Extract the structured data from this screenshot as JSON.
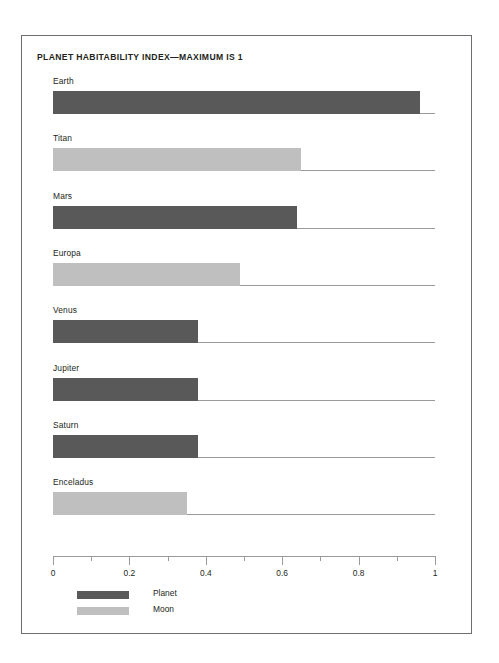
{
  "chart_data": {
    "type": "bar",
    "orientation": "horizontal",
    "title": "PLANET HABITABILITY INDEX—MAXIMUM IS 1",
    "xlabel": "",
    "ylabel": "",
    "xlim": [
      0,
      1
    ],
    "grid": false,
    "legend_position": "bottom-left",
    "categories": [
      "Earth",
      "Titan",
      "Mars",
      "Europa",
      "Venus",
      "Jupiter",
      "Saturn",
      "Enceladus"
    ],
    "values": [
      0.96,
      0.65,
      0.64,
      0.49,
      0.38,
      0.38,
      0.38,
      0.35
    ],
    "groups": [
      "Planet",
      "Moon",
      "Planet",
      "Moon",
      "Planet",
      "Planet",
      "Planet",
      "Moon"
    ],
    "tick_labels": [
      "0",
      "0.2",
      "0.4",
      "0.6",
      "0.8",
      "1"
    ],
    "tick_values": [
      0,
      0.2,
      0.4,
      0.6,
      0.8,
      1
    ],
    "minor_tick_values": [
      0.1,
      0.3,
      0.5,
      0.7,
      0.9
    ],
    "legend": [
      {
        "label": "Planet",
        "color": "#595959"
      },
      {
        "label": "Moon",
        "color": "#bfbfbf"
      }
    ],
    "bars": [
      {
        "label": "Earth",
        "value": 0.96,
        "group": "Planet",
        "color": "#595959"
      },
      {
        "label": "Titan",
        "value": 0.65,
        "group": "Moon",
        "color": "#bfbfbf"
      },
      {
        "label": "Mars",
        "value": 0.64,
        "group": "Planet",
        "color": "#595959"
      },
      {
        "label": "Europa",
        "value": 0.49,
        "group": "Moon",
        "color": "#bfbfbf"
      },
      {
        "label": "Venus",
        "value": 0.38,
        "group": "Planet",
        "color": "#595959"
      },
      {
        "label": "Jupiter",
        "value": 0.38,
        "group": "Planet",
        "color": "#595959"
      },
      {
        "label": "Saturn",
        "value": 0.38,
        "group": "Planet",
        "color": "#595959"
      },
      {
        "label": "Enceladus",
        "value": 0.35,
        "group": "Moon",
        "color": "#bfbfbf"
      }
    ]
  },
  "colors": {
    "planet": "#595959",
    "moon": "#bfbfbf",
    "axis": "#9a9a9a",
    "frame": "#6d6e71",
    "text": "#231f20",
    "background": "#ffffff"
  }
}
